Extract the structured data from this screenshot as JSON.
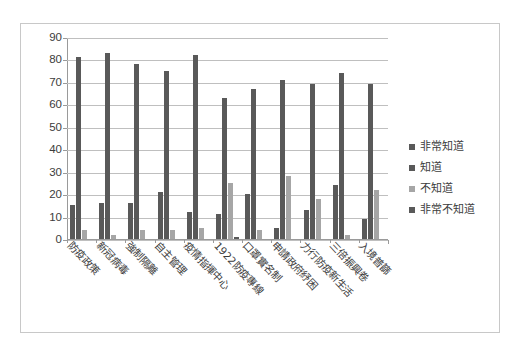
{
  "chart_data": {
    "type": "bar",
    "title": "",
    "subtitle": "",
    "xlabel": "",
    "ylabel": "",
    "ylim": [
      0,
      90
    ],
    "ytick_step": 10,
    "yticks": [
      "90",
      "80",
      "70",
      "60",
      "50",
      "40",
      "30",
      "20",
      "10",
      "0"
    ],
    "grid": true,
    "legend_position": "right",
    "categories": [
      "防疫政策",
      "新冠病毒",
      "強制隔離",
      "自主管理",
      "疫情指揮中心",
      "1922防疫專線",
      "口罩實名制",
      "申請政府紓困",
      "力行防疫新生活",
      "三倍振興卷",
      "入境普篩"
    ],
    "series": [
      {
        "name": "非常知道",
        "color": "#595959",
        "values": [
          15,
          16,
          16,
          21,
          12,
          11,
          20,
          5,
          13,
          24,
          9
        ]
      },
      {
        "name": "知道",
        "color": "#595959",
        "values": [
          81,
          83,
          78,
          75,
          82,
          63,
          67,
          71,
          69,
          74,
          69
        ]
      },
      {
        "name": "不知道",
        "color": "#a6a6a6",
        "values": [
          4,
          2,
          4,
          4,
          5,
          25,
          4,
          28,
          18,
          2,
          22
        ]
      },
      {
        "name": "非常不知道",
        "color": "#595959",
        "values": [
          0,
          0,
          0,
          0,
          0,
          1,
          0,
          0,
          0,
          0,
          0
        ]
      }
    ]
  },
  "legend": {
    "items": [
      {
        "label": "非常知道",
        "color": "#595959"
      },
      {
        "label": "知道",
        "color": "#595959"
      },
      {
        "label": "不知道",
        "color": "#a6a6a6"
      },
      {
        "label": "非常不知道",
        "color": "#595959"
      }
    ]
  }
}
